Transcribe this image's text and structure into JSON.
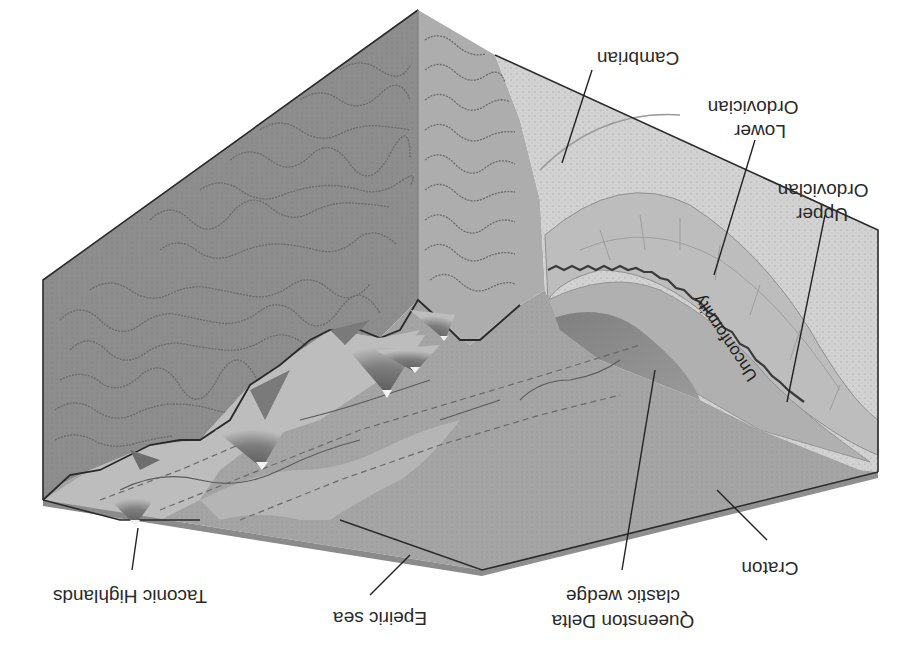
{
  "diagram": {
    "orientation": "upside-down",
    "labels": {
      "cambrian": "Cambrian",
      "lower_ordovician_1": "Lower",
      "lower_ordovician_2": "Ordovician",
      "upper_ordovician_1": "Upper",
      "upper_ordovician_2": "Ordovician",
      "unconformity": "Unconformity",
      "queenston_1": "Queenston Delta",
      "queenston_2": "clastic wedge",
      "craton": "Craton",
      "epeiric_sea": "Epeiric sea",
      "taconic_highlands": "Taconic Highlands"
    },
    "colors": {
      "left_face": "#8c8c8c",
      "back_face_metamorphic": "#a9a9a9",
      "cambrian_layer": "#cfcfcf",
      "ordovician_layers": "#b8b8b8",
      "clastic_wedge": "#8a8a8a",
      "craton_surface": "#a3a3a3",
      "slab_edge": "#8f8f8f",
      "highlands_light": "#c4c4c4",
      "highlands_dark": "#6e6e6e"
    }
  }
}
